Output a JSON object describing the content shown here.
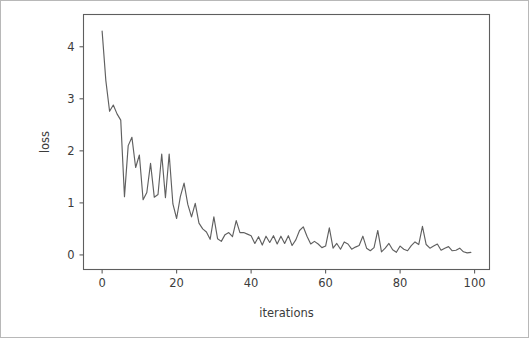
{
  "figure": {
    "background_color": "#ffffff",
    "border_color": "#b8b8b8",
    "axes_color": "#5e5e5e",
    "line_color": "#606060"
  },
  "chart_data": {
    "type": "line",
    "title": "",
    "xlabel": "iterations",
    "ylabel": "loss",
    "xlim": [
      -5.0,
      104.0
    ],
    "ylim": [
      -0.28,
      4.62
    ],
    "xticks": [
      0,
      20,
      40,
      60,
      80,
      100
    ],
    "yticks": [
      0,
      1,
      2,
      3,
      4
    ],
    "xtick_labels": [
      "0",
      "20",
      "40",
      "60",
      "80",
      "100"
    ],
    "ytick_labels": [
      "0",
      "1",
      "2",
      "3",
      "4"
    ],
    "grid": false,
    "legend": null,
    "series": [
      {
        "name": "loss",
        "color": "#606060",
        "x": [
          0,
          1,
          2,
          3,
          4,
          5,
          6,
          7,
          8,
          9,
          10,
          11,
          12,
          13,
          14,
          15,
          16,
          17,
          18,
          19,
          20,
          21,
          22,
          23,
          24,
          25,
          26,
          27,
          28,
          29,
          30,
          31,
          32,
          33,
          34,
          35,
          36,
          37,
          38,
          39,
          40,
          41,
          42,
          43,
          44,
          45,
          46,
          47,
          48,
          49,
          50,
          51,
          52,
          53,
          54,
          55,
          56,
          57,
          58,
          59,
          60,
          61,
          62,
          63,
          64,
          65,
          66,
          67,
          68,
          69,
          70,
          71,
          72,
          73,
          74,
          75,
          76,
          77,
          78,
          79,
          80,
          81,
          82,
          83,
          84,
          85,
          86,
          87,
          88,
          89,
          90,
          91,
          92,
          93,
          94,
          95,
          96,
          97,
          98,
          99
        ],
        "y": [
          4.3,
          3.35,
          2.76,
          2.88,
          2.71,
          2.59,
          1.12,
          2.1,
          2.26,
          1.68,
          1.92,
          1.06,
          1.2,
          1.76,
          1.11,
          1.16,
          1.94,
          1.1,
          1.94,
          0.98,
          0.7,
          1.12,
          1.38,
          0.97,
          0.73,
          0.99,
          0.61,
          0.5,
          0.44,
          0.3,
          0.73,
          0.31,
          0.26,
          0.39,
          0.43,
          0.35,
          0.66,
          0.43,
          0.43,
          0.4,
          0.37,
          0.22,
          0.35,
          0.19,
          0.36,
          0.24,
          0.37,
          0.21,
          0.36,
          0.22,
          0.37,
          0.18,
          0.29,
          0.47,
          0.54,
          0.36,
          0.21,
          0.26,
          0.21,
          0.14,
          0.17,
          0.52,
          0.13,
          0.22,
          0.11,
          0.25,
          0.21,
          0.11,
          0.15,
          0.18,
          0.36,
          0.13,
          0.08,
          0.14,
          0.47,
          0.06,
          0.13,
          0.22,
          0.1,
          0.05,
          0.17,
          0.11,
          0.08,
          0.18,
          0.25,
          0.2,
          0.55,
          0.2,
          0.13,
          0.17,
          0.21,
          0.09,
          0.13,
          0.16,
          0.08,
          0.09,
          0.13,
          0.06,
          0.04,
          0.05
        ]
      }
    ]
  }
}
